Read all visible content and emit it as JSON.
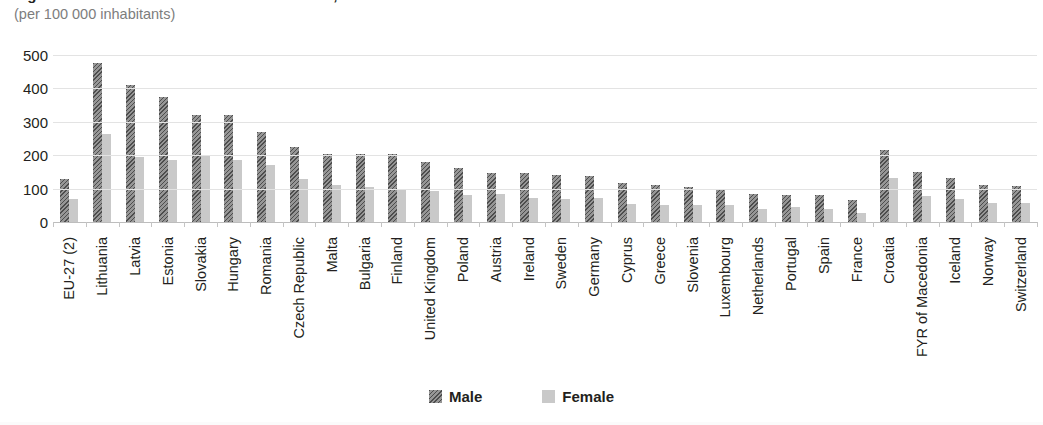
{
  "header": {
    "title_clipped": "Figure: Standardised death rate from suicide, 2010",
    "subtitle": "(per 100 000 inhabitants)"
  },
  "legend": {
    "position": "bottom-center",
    "items": [
      {
        "label": "Male",
        "icon": "hatched-square-swatch",
        "color": "#6e6e6e"
      },
      {
        "label": "Female",
        "icon": "solid-square-swatch",
        "color": "#c9c9c9"
      }
    ]
  },
  "colors": {
    "male": "#6e6e6e",
    "female": "#c9c9c9",
    "gridline": "#e3e3e3",
    "axis": "#bdbdbd",
    "text": "#231f20",
    "subtitle": "#7d7d7d"
  },
  "chart_data": {
    "type": "bar",
    "title": "Standardised death rate from suicide, 2010",
    "subtitle": "(per 100 000 inhabitants)",
    "xlabel": "",
    "ylabel": "",
    "ylim": [
      0,
      500
    ],
    "yticks": [
      0,
      100,
      200,
      300,
      400,
      500
    ],
    "ytick_labels": [
      "0",
      "100",
      "200",
      "300",
      "400",
      "500"
    ],
    "grid": true,
    "grid_axis": "y",
    "legend_position": "bottom-center",
    "categories": [
      "EU-27 (2)",
      "Lithuania",
      "Latvia",
      "Estonia",
      "Slovakia",
      "Hungary",
      "Romania",
      "Czech Republic",
      "Malta",
      "Bulgaria",
      "Finland",
      "United Kingdom",
      "Poland",
      "Austria",
      "Ireland",
      "Sweden",
      "Germany",
      "Cyprus",
      "Greece",
      "Slovenia",
      "Luxembourg",
      "Netherlands",
      "Portugal",
      "Spain",
      "France",
      "Croatia",
      "FYR of Macedonia",
      "Iceland",
      "Norway",
      "Switzerland"
    ],
    "series": [
      {
        "name": "Male",
        "color": "#6e6e6e",
        "values": [
          130,
          475,
          410,
          375,
          320,
          320,
          270,
          225,
          205,
          203,
          203,
          180,
          162,
          148,
          148,
          142,
          138,
          118,
          112,
          105,
          100,
          85,
          80,
          82,
          65,
          215,
          150,
          133,
          110,
          108
        ]
      },
      {
        "name": "Female",
        "color": "#c9c9c9",
        "values": [
          68,
          265,
          196,
          185,
          200,
          186,
          170,
          130,
          112,
          105,
          96,
          92,
          80,
          83,
          72,
          70,
          73,
          55,
          52,
          52,
          50,
          38,
          45,
          38,
          28,
          133,
          78,
          68,
          58,
          57
        ]
      }
    ]
  }
}
